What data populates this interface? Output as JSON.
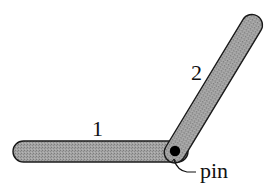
{
  "diagram": {
    "type": "linkage",
    "colors": {
      "rod_fill": "#9a9a9a",
      "rod_stroke": "#1a1a1a",
      "pin_fill": "#000000",
      "background": "#ffffff"
    },
    "rods": [
      {
        "id": "rod-1",
        "label": "1"
      },
      {
        "id": "rod-2",
        "label": "2"
      }
    ],
    "pin": {
      "label": "pin"
    }
  }
}
